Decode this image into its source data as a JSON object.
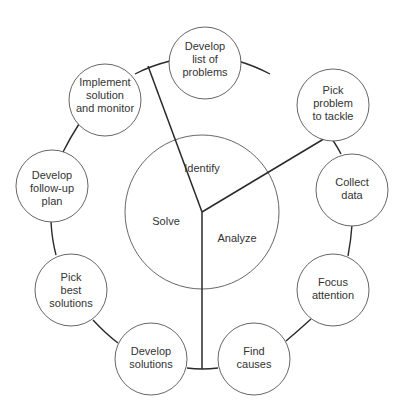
{
  "diagram": {
    "type": "cycle",
    "hub": {
      "center": [
        202,
        212
      ],
      "radius": 77,
      "sections": [
        {
          "label": "Identify",
          "pos": [
            202,
            169
          ]
        },
        {
          "label": "Solve",
          "pos": [
            166,
            222
          ]
        },
        {
          "label": "Analyze",
          "pos": [
            237,
            239
          ]
        }
      ],
      "dividers": [
        {
          "to": [
            148,
            66
          ]
        },
        {
          "to": [
            332,
            134
          ]
        },
        {
          "to": [
            202,
            369
          ]
        }
      ]
    },
    "steps": [
      {
        "id": "develop-list-of-problems",
        "lines": [
          "Develop",
          "list of",
          "problems"
        ],
        "center": [
          205,
          63
        ]
      },
      {
        "id": "pick-problem-to-tackle",
        "lines": [
          "Pick",
          "problem",
          "to tackle"
        ],
        "center": [
          333,
          105
        ]
      },
      {
        "id": "collect-data",
        "lines": [
          "Collect",
          "data"
        ],
        "center": [
          352,
          190
        ]
      },
      {
        "id": "focus-attention",
        "lines": [
          "Focus",
          "attention"
        ],
        "center": [
          333,
          290
        ]
      },
      {
        "id": "find-causes",
        "lines": [
          "Find",
          "causes"
        ],
        "center": [
          254,
          359
        ]
      },
      {
        "id": "develop-solutions",
        "lines": [
          "Develop",
          "solutions"
        ],
        "center": [
          151,
          359
        ]
      },
      {
        "id": "pick-best-solutions",
        "lines": [
          "Pick",
          "best",
          "solutions"
        ],
        "center": [
          71,
          290
        ]
      },
      {
        "id": "develop-follow-up-plan",
        "lines": [
          "Develop",
          "follow-up",
          "plan"
        ],
        "center": [
          52,
          186
        ]
      },
      {
        "id": "implement-solution-and-monitor",
        "lines": [
          "Implement",
          "solution",
          "and monitor"
        ],
        "center": [
          105,
          100
        ]
      }
    ],
    "step_radius": 36,
    "colors": {
      "stroke": "#2a2a2a",
      "text": "#333333",
      "background": "#ffffff"
    }
  }
}
